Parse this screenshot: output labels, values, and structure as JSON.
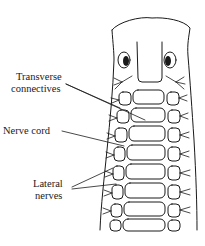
{
  "figure": {
    "labels": {
      "transverse_line1": "Transverse",
      "transverse_line2": "connectives",
      "nerve_cord": "Nerve cord",
      "lateral_line1": "Lateral",
      "lateral_line2": "nerves"
    },
    "segments_count": 8,
    "colors": {
      "ink": "#1a1a1a",
      "background": "#ffffff"
    }
  }
}
